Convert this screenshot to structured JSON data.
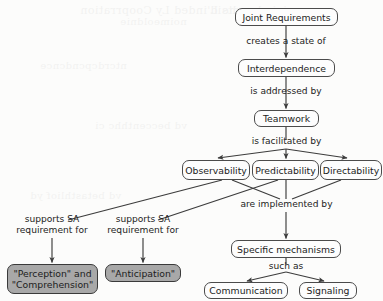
{
  "diagram": {
    "stroke_color": "#4b4b4b",
    "shaded_fill": "#a8a8a8",
    "plain_fill": "#fdfdfd",
    "background": "#fcfcfb",
    "nodes": [
      {
        "id": "joint-requirements",
        "label": "Joint Requirements",
        "style": "plain"
      },
      {
        "id": "interdependence",
        "label": "Interdependence",
        "style": "plain"
      },
      {
        "id": "teamwork",
        "label": "Teamwork",
        "style": "plain"
      },
      {
        "id": "observability",
        "label": "Observability",
        "style": "plain"
      },
      {
        "id": "predictability",
        "label": "Predictability",
        "style": "plain"
      },
      {
        "id": "directability",
        "label": "Directability",
        "style": "plain"
      },
      {
        "id": "specific-mechanisms",
        "label": "Specific mechanisms",
        "style": "plain"
      },
      {
        "id": "communication",
        "label": "Communication",
        "style": "plain"
      },
      {
        "id": "signaling",
        "label": "Signaling",
        "style": "plain"
      },
      {
        "id": "perception-comprehension",
        "label": "\"Perception\" and \"Comprehension\"",
        "style": "shaded"
      },
      {
        "id": "anticipation",
        "label": "\"Anticipation\"",
        "style": "shaded"
      }
    ],
    "edge_labels": [
      {
        "id": "creates-a-state-of",
        "text": "creates a state of"
      },
      {
        "id": "is-addressed-by",
        "text": "is addressed by"
      },
      {
        "id": "is-facilitated-by",
        "text": "is facilitated by"
      },
      {
        "id": "are-implemented-by",
        "text": "are implemented by"
      },
      {
        "id": "such-as",
        "text": "such as"
      },
      {
        "id": "supports-sa-requirement-for-left",
        "text": "supports SA requirement for"
      },
      {
        "id": "supports-sa-requirement-for-right",
        "text": "supports SA requirement for"
      }
    ],
    "ghost_text": [
      {
        "text": "he L'inded Ly Cooprration",
        "x": 80,
        "y": 4,
        "size": 11
      },
      {
        "text": "rejoind contsid",
        "x": 210,
        "y": 4,
        "size": 11
      },
      {
        "text": "noimeoldnie",
        "x": 120,
        "y": 16,
        "size": 10
      },
      {
        "text": "ntcrdcpcndcnce",
        "x": 40,
        "y": 60,
        "size": 10
      },
      {
        "text": "vd beccenthhc ci",
        "x": 95,
        "y": 120,
        "size": 10
      },
      {
        "text": "vd betasthliof yd",
        "x": 30,
        "y": 190,
        "size": 10
      }
    ]
  }
}
